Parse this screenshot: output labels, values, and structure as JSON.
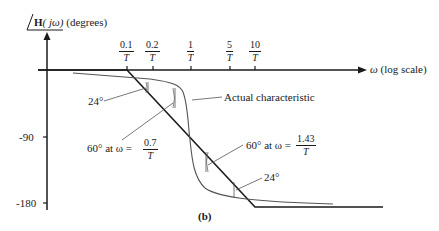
{
  "figure": {
    "panel_label": "(b)",
    "y_axis_title": {
      "angle_symbol": "∠",
      "bold_part": "H",
      "arg": "( jω)",
      "unit": "(degrees)"
    },
    "x_axis_title": {
      "symbol": "ω",
      "unit": "(log scale)"
    },
    "y_ticks": [
      "-90",
      "-180"
    ],
    "x_ticks": [
      {
        "num": "0.1",
        "den": "T"
      },
      {
        "num": "0.2",
        "den": "T"
      },
      {
        "num": "1",
        "den": "T"
      },
      {
        "num": "5",
        "den": "T"
      },
      {
        "num": "10",
        "den": "T"
      }
    ],
    "annotations": {
      "actual": "Actual characteristic",
      "deg24_left": "24°",
      "deg24_right": "24°",
      "sixty_left_text": "60° at ω =",
      "sixty_left_num": "0.7",
      "sixty_left_den": "T",
      "sixty_right_text": "60° at ω =",
      "sixty_right_num": "1.43",
      "sixty_right_den": "T"
    }
  },
  "colors": {
    "axis": "#1a1a1a",
    "asymptote": "#1a1a1a",
    "actual_curve": "#555555"
  }
}
